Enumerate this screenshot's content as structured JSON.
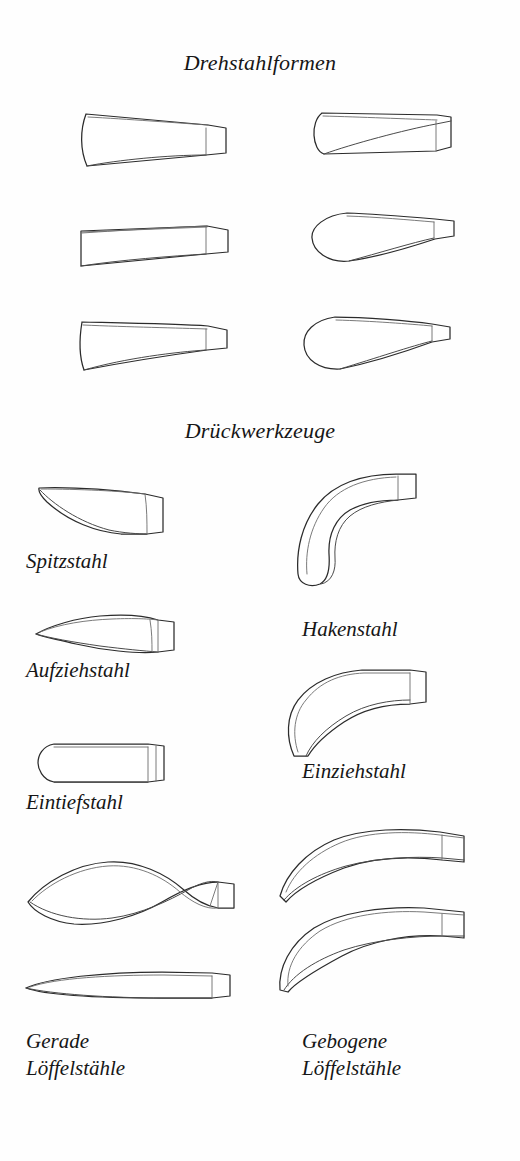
{
  "page": {
    "background_color": "#fefefe",
    "ink_color": "#2b2b2b",
    "width": 520,
    "height": 1161
  },
  "sections": [
    {
      "heading": "Drehstahlformen",
      "figure_count": 6,
      "figures": [
        {
          "name": "tapered-flat-tool-curved-edge",
          "row": 1,
          "column": "left"
        },
        {
          "name": "flat-tool-rounded-nose",
          "row": 1,
          "column": "right"
        },
        {
          "name": "tapered-flat-tool-straight",
          "row": 2,
          "column": "left"
        },
        {
          "name": "spoon-tool-round-nose",
          "row": 2,
          "column": "right"
        },
        {
          "name": "tapered-flat-tool-concave",
          "row": 3,
          "column": "left"
        },
        {
          "name": "spoon-tool-broad-nose",
          "row": 3,
          "column": "right"
        }
      ]
    },
    {
      "heading": "Drückwerkzeuge",
      "figure_count": 8,
      "figures": [
        {
          "name": "spitzstahl-tool",
          "label": "Spitzstahl",
          "column": "left"
        },
        {
          "name": "hakenstahl-tool",
          "label": "Hakenstahl",
          "column": "right"
        },
        {
          "name": "aufziehstahl-tool",
          "label": "Aufziehstahl",
          "column": "left"
        },
        {
          "name": "einziehstahl-tool",
          "label": "Einziehstahl",
          "column": "right"
        },
        {
          "name": "eintiefstahl-tool",
          "label": "Eintiefstahl",
          "column": "left"
        },
        {
          "name": "gerade-loeffelstahl-tool-upper",
          "label": "Gerade\nLöffelstähle",
          "column": "left"
        },
        {
          "name": "gerade-loeffelstahl-tool-lower",
          "label": "",
          "column": "left"
        },
        {
          "name": "gebogene-loeffelstahl-tool-upper",
          "label": "Gebogene\nLöffelstähle",
          "column": "right"
        },
        {
          "name": "gebogene-loeffelstahl-tool-lower",
          "label": "",
          "column": "right"
        }
      ]
    }
  ],
  "headings": {
    "drehstahlformen": "Drehstahlformen",
    "drueckwerkzeuge": "Drückwerkzeuge"
  },
  "labels": {
    "spitzstahl": "Spitzstahl",
    "hakenstahl": "Hakenstahl",
    "aufziehstahl": "Aufziehstahl",
    "einziehstahl": "Einziehstahl",
    "eintiefstahl": "Eintiefstahl",
    "gerade_loeffelstaehle": "Gerade\nLöffelstähle",
    "gebogene_loeffelstaehle": "Gebogene\nLöffelstähle"
  }
}
